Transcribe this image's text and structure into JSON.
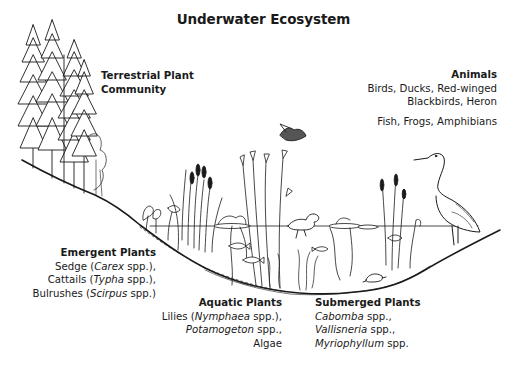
{
  "title": "Underwater Ecosystem",
  "labels": {
    "terrestrial": {
      "heading_line1": "Terrestrial Plant",
      "heading_line2": "Community"
    },
    "animals": {
      "heading": "Animals",
      "line1": "Birds, Ducks, Red-winged",
      "line2": "Blackbirds, Heron",
      "line3": "Fish, Frogs, Amphibians"
    },
    "emergent": {
      "heading": "Emergent Plants",
      "lines": [
        {
          "pre": "Sedge (",
          "italic": "Carex",
          "post": " spp.),"
        },
        {
          "pre": "Cattails (",
          "italic": "Typha",
          "post": " spp.),"
        },
        {
          "pre": "Bulrushes (",
          "italic": "Scirpus",
          "post": " spp.)"
        }
      ]
    },
    "aquatic": {
      "heading": "Aquatic Plants",
      "lines": [
        {
          "pre": "Lilies (",
          "italic": "Nymphaea",
          "post": " spp.),"
        },
        {
          "pre": "",
          "italic": "Potamogeton",
          "post": " spp.,"
        },
        {
          "pre": "Algae",
          "italic": "",
          "post": ""
        }
      ]
    },
    "submerged": {
      "heading": "Submerged Plants",
      "lines": [
        {
          "pre": "",
          "italic": "Cabomba",
          "post": " spp.,"
        },
        {
          "pre": "",
          "italic": "Vallisneria",
          "post": " spp.,"
        },
        {
          "pre": "",
          "italic": "Myriophyllum",
          "post": " spp."
        }
      ]
    }
  },
  "illustration": {
    "elements": [
      "conifer-trees",
      "shrubs",
      "shoreline-slope",
      "water-surface",
      "cattails",
      "reeds",
      "water-lilies",
      "flying-bird",
      "duck",
      "fish",
      "turtle",
      "heron",
      "submerged-weeds",
      "pond-basin"
    ],
    "line_color": "#1a1a1a"
  }
}
